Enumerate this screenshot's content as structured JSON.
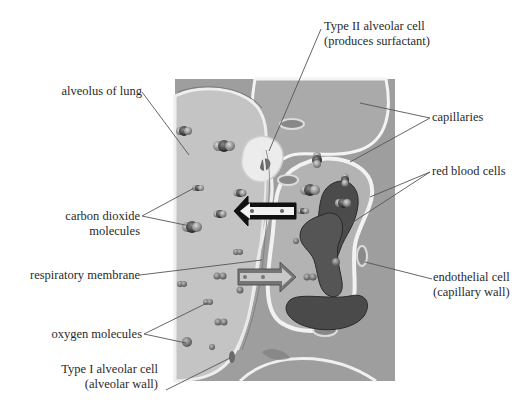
{
  "diagram": {
    "colors": {
      "background": "#ffffff",
      "interstitial": "#9a9a9a",
      "alveolus_fill": "#c4c4c4",
      "capillary_fill": "#a9a9a9",
      "red_blood_cell": "#4a4a4a",
      "label_text": "#2a2a2a",
      "leader_line": "#555555",
      "co2_arrow": "#111111",
      "o2_arrow": "#6a6a6a"
    },
    "labels": {
      "alveolus": "alveolus of lung",
      "type2_line1": "Type II alveolar cell",
      "type2_line2": "(produces surfactant)",
      "capillaries": "capillaries",
      "co2_line1": "carbon dioxide",
      "co2_line2": "molecules",
      "red_blood_cells": "red blood cells",
      "respiratory_membrane": "respiratory membrane",
      "endothelial_line1": "endothelial cell",
      "endothelial_line2": "(capillary wall)",
      "oxygen": "oxygen molecules",
      "type1_line1": "Type I alveolar cell",
      "type1_line2": "(alveolar wall)"
    },
    "arrows": [
      {
        "name": "co2-diffusion-arrow",
        "direction": "left",
        "from": "capillary",
        "to": "alveolus"
      },
      {
        "name": "o2-diffusion-arrow",
        "direction": "right",
        "from": "alveolus",
        "to": "capillary"
      }
    ]
  }
}
